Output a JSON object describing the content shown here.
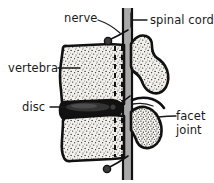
{
  "figure": {
    "background_color": "#ffffff",
    "ink_color": "#111111",
    "bone_fill_color": "#f2f1ec",
    "stipple_color": "#2a2a2a",
    "disc_color": "#121212",
    "cord_fill_color": "#a9a9a9",
    "width": 214,
    "height": 183
  },
  "labels": {
    "nerve": "nerve",
    "spinal_cord": "spinal  cord",
    "vertebra": "vertebra",
    "disc": "disc",
    "facet": "facet",
    "joint": "joint"
  },
  "structures": {
    "upper_vertebral_body": "upper-vertebra-body",
    "lower_vertebral_body": "lower-vertebra-body",
    "intervertebral_disc": "intervertebral-disc",
    "spinal_canal": "spinal-canal",
    "spinous_process_upper": "upper-spinous-process",
    "spinous_process_lower": "lower-spinous-process",
    "facet_joint": "facet-joint",
    "nerve_root_upper": "upper-nerve-root",
    "nerve_root_middle": "middle-nerve-root",
    "nerve_root_lower": "lower-nerve-root"
  }
}
